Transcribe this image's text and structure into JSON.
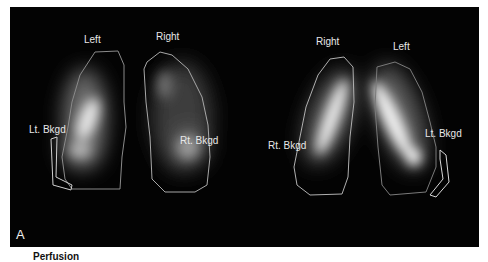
{
  "figure": {
    "panel_letter": "A",
    "caption": "Perfusion",
    "colors": {
      "background": "#030303",
      "roi_outline": "#bdbdbd",
      "label_text": "#e8e8e8"
    },
    "left_view": {
      "labels": {
        "top_left": "Left",
        "top_right": "Right",
        "bkgd_left": "Lt. Bkgd",
        "bkgd_right": "Rt. Bkgd"
      }
    },
    "right_view": {
      "labels": {
        "top_left": "Right",
        "top_right": "Left",
        "bkgd_left": "Rt. Bkgd",
        "bkgd_right": "Lt. Bkgd"
      }
    }
  }
}
